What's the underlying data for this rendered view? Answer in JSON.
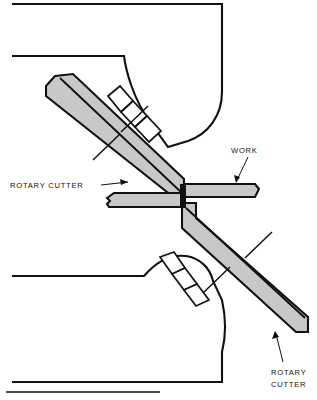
{
  "figure": {
    "kind": "technical-cross-section-diagram",
    "background_color": "#ffffff",
    "line_color": "#111111",
    "metal_fill_color": "#c8c8c8",
    "housing_fill_color": "#ffffff"
  },
  "labels": {
    "rotary_cutter_left": "ROTARY CUTTER",
    "work": "WORK",
    "rotary_cutter_bottom_line1": "ROTARY",
    "rotary_cutter_bottom_line2": "CUTTER"
  },
  "parts": [
    {
      "id": "upper-cutter",
      "name": "Upper rotary cutter blade",
      "fill": "#c8c8c8",
      "orientation": "diagonal-down-right"
    },
    {
      "id": "lower-cutter",
      "name": "Lower rotary cutter blade",
      "fill": "#c8c8c8",
      "orientation": "diagonal-down-right"
    },
    {
      "id": "work-left",
      "name": "Workpiece, left segment",
      "fill": "#c8c8c8",
      "orientation": "horizontal"
    },
    {
      "id": "work-right",
      "name": "Workpiece, right segment",
      "fill": "#c8c8c8",
      "orientation": "horizontal"
    },
    {
      "id": "upper-housing",
      "name": "Upper machine housing section",
      "fill": "#ffffff"
    },
    {
      "id": "lower-housing",
      "name": "Lower machine housing section",
      "fill": "#ffffff"
    }
  ]
}
